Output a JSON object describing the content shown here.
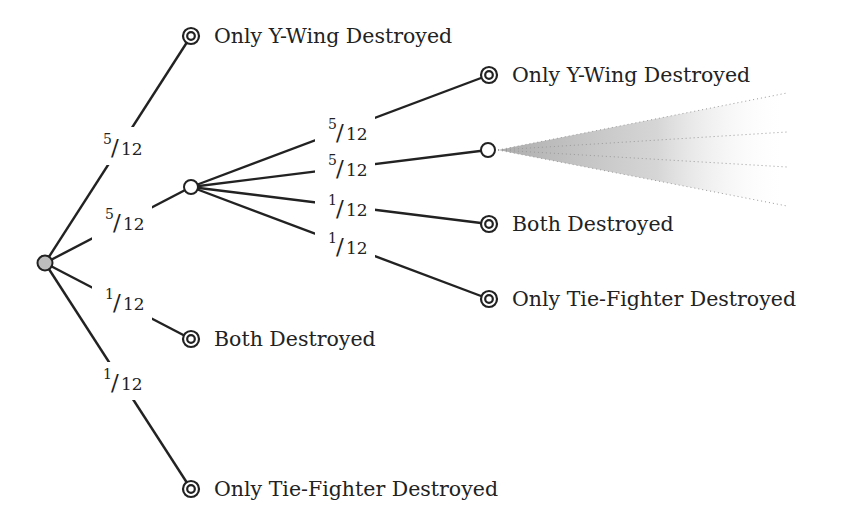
{
  "diagram": {
    "type": "probability-tree",
    "colors": {
      "edge": "#222222",
      "root_fill": "#bdbdbd",
      "fan_shade": "#b5b5b5",
      "background": "#ffffff"
    },
    "nodes": [
      {
        "id": "root",
        "kind": "root",
        "x": 45,
        "y": 263
      },
      {
        "id": "n_top",
        "kind": "terminal",
        "x": 191,
        "y": 36,
        "label": "Only Y-Wing Destroyed"
      },
      {
        "id": "n_mid",
        "kind": "chance",
        "x": 191,
        "y": 187
      },
      {
        "id": "n_both",
        "kind": "terminal",
        "x": 191,
        "y": 339,
        "label": "Both Destroyed"
      },
      {
        "id": "n_tie",
        "kind": "terminal",
        "x": 191,
        "y": 489,
        "label": "Only Tie-Fighter Destroyed"
      },
      {
        "id": "r_y",
        "kind": "terminal",
        "x": 489,
        "y": 75,
        "label": "Only Y-Wing Destroyed"
      },
      {
        "id": "r_rep",
        "kind": "chance",
        "x": 488,
        "y": 150
      },
      {
        "id": "r_both",
        "kind": "terminal",
        "x": 489,
        "y": 224,
        "label": "Both Destroyed"
      },
      {
        "id": "r_tie",
        "kind": "terminal",
        "x": 489,
        "y": 299,
        "label": "Only Tie-Fighter Destroyed"
      }
    ],
    "edges": [
      {
        "from": "root",
        "to": "n_top",
        "num": "5",
        "den": "12",
        "lx": 120,
        "ly": 146
      },
      {
        "from": "root",
        "to": "n_mid",
        "num": "5",
        "den": "12",
        "lx": 122,
        "ly": 221
      },
      {
        "from": "root",
        "to": "n_both",
        "num": "1",
        "den": "12",
        "lx": 122,
        "ly": 301
      },
      {
        "from": "root",
        "to": "n_tie",
        "num": "1",
        "den": "12",
        "lx": 120,
        "ly": 381
      },
      {
        "from": "n_mid",
        "to": "r_y",
        "num": "5",
        "den": "12",
        "lx": 345,
        "ly": 131
      },
      {
        "from": "n_mid",
        "to": "r_rep",
        "num": "5",
        "den": "12",
        "lx": 345,
        "ly": 167
      },
      {
        "from": "n_mid",
        "to": "r_both",
        "num": "1",
        "den": "12",
        "lx": 345,
        "ly": 207
      },
      {
        "from": "n_mid",
        "to": "r_tie",
        "num": "1",
        "den": "12",
        "lx": 345,
        "ly": 245
      }
    ],
    "continuation_fan": {
      "apex_x": 498,
      "apex_y": 150,
      "end_x": 787,
      "ends_y": [
        93,
        132,
        167,
        206
      ]
    }
  }
}
